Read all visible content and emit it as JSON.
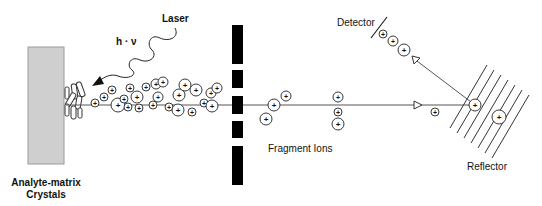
{
  "diagram": {
    "labels": {
      "laser": "Laser",
      "photon": "h · ν",
      "sample_line1": "Analyte-matrix",
      "sample_line2": "Crystals",
      "fragments": "Fragment Ions",
      "detector": "Detector",
      "reflector": "Reflector"
    },
    "ion_symbol": "+",
    "colors": {
      "sample_fill": "#cfcfcf",
      "sample_stroke": "#9a9a9a",
      "barrier": "#000000",
      "line": "#555555",
      "ion_stroke": "#222222"
    },
    "ion_cloud": [
      {
        "x": 95,
        "y": 103,
        "r": 4
      },
      {
        "x": 104,
        "y": 97,
        "r": 4
      },
      {
        "x": 112,
        "y": 90,
        "r": 4
      },
      {
        "x": 118,
        "y": 105,
        "r": 7
      },
      {
        "x": 124,
        "y": 99,
        "r": 4
      },
      {
        "x": 130,
        "y": 88,
        "r": 4
      },
      {
        "x": 128,
        "y": 107,
        "r": 4
      },
      {
        "x": 137,
        "y": 97,
        "r": 6
      },
      {
        "x": 139,
        "y": 108,
        "r": 4
      },
      {
        "x": 146,
        "y": 87,
        "r": 4
      },
      {
        "x": 153,
        "y": 105,
        "r": 4
      },
      {
        "x": 156,
        "y": 84,
        "r": 5
      },
      {
        "x": 158,
        "y": 97,
        "r": 5
      },
      {
        "x": 163,
        "y": 82,
        "r": 5
      },
      {
        "x": 169,
        "y": 107,
        "r": 4
      },
      {
        "x": 178,
        "y": 110,
        "r": 6
      },
      {
        "x": 179,
        "y": 95,
        "r": 6
      },
      {
        "x": 185,
        "y": 85,
        "r": 6
      },
      {
        "x": 192,
        "y": 112,
        "r": 4
      },
      {
        "x": 196,
        "y": 90,
        "r": 6
      },
      {
        "x": 204,
        "y": 103,
        "r": 4
      },
      {
        "x": 211,
        "y": 93,
        "r": 5
      },
      {
        "x": 212,
        "y": 106,
        "r": 6
      },
      {
        "x": 217,
        "y": 88,
        "r": 5
      }
    ],
    "fragment_ions": [
      {
        "x": 274,
        "y": 105,
        "r": 6
      },
      {
        "x": 286,
        "y": 96,
        "r": 5
      },
      {
        "x": 266,
        "y": 119,
        "r": 6
      },
      {
        "x": 338,
        "y": 97,
        "r": 5
      },
      {
        "x": 338,
        "y": 112,
        "r": 4
      },
      {
        "x": 338,
        "y": 124,
        "r": 6
      }
    ],
    "other_ions": [
      {
        "x": 435,
        "y": 112,
        "r": 4
      },
      {
        "x": 475,
        "y": 105,
        "r": 6
      },
      {
        "x": 499,
        "y": 117,
        "r": 7
      },
      {
        "x": 383,
        "y": 34,
        "r": 4
      },
      {
        "x": 393,
        "y": 41,
        "r": 5
      },
      {
        "x": 404,
        "y": 50,
        "r": 6
      }
    ]
  }
}
